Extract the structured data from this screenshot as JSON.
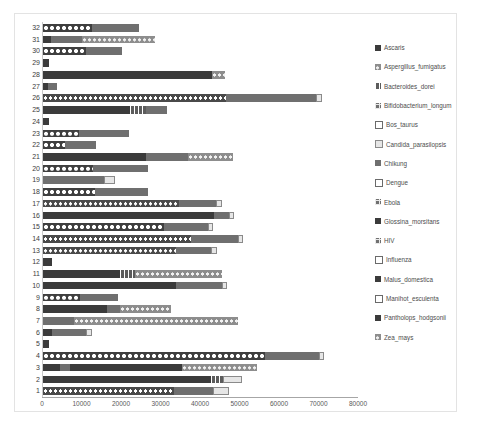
{
  "chart_data": {
    "type": "bar",
    "orientation": "horizontal",
    "stacked": true,
    "title": "",
    "xlabel": "",
    "ylabel": "",
    "xlim": [
      0,
      80000
    ],
    "xticks": [
      0,
      10000,
      20000,
      30000,
      40000,
      50000,
      60000,
      70000,
      80000
    ],
    "xtick_labels": [
      "0",
      "10000",
      "20000",
      "30000",
      "40000",
      "50000",
      "60000",
      "70000",
      "80000"
    ],
    "grid": false,
    "legend_position": "right",
    "categories": [
      "1",
      "2",
      "3",
      "4",
      "5",
      "6",
      "7",
      "8",
      "9",
      "10",
      "11",
      "12",
      "13",
      "14",
      "15",
      "16",
      "17",
      "18",
      "19",
      "20",
      "21",
      "22",
      "23",
      "24",
      "25",
      "26",
      "27",
      "28",
      "29",
      "30",
      "31",
      "32"
    ],
    "series": [
      {
        "name": "Ascaris",
        "pattern": "solidDark",
        "color": "#3b3b3b"
      },
      {
        "name": "Aspergillus_fumigatus",
        "pattern": "dotsGray",
        "color": "#8d8d8d"
      },
      {
        "name": "Bacteroides_dorei",
        "pattern": "hatch",
        "color": "#5c5c5c"
      },
      {
        "name": "Bifidobacterium_longum",
        "pattern": "grid",
        "color": "#707070"
      },
      {
        "name": "Bos_taurus",
        "pattern": "open",
        "color": "#ffffff"
      },
      {
        "name": "Candida_parasilopsis",
        "pattern": "openGray",
        "color": "#e6e6e6"
      },
      {
        "name": "Chikung",
        "pattern": "solidMid",
        "color": "#6f6f6f"
      },
      {
        "name": "Dengue",
        "pattern": "open",
        "color": "#ffffff"
      },
      {
        "name": "Ebola",
        "pattern": "grid",
        "color": "#707070"
      },
      {
        "name": "Glossina_morsitans",
        "pattern": "solidDark",
        "color": "#3b3b3b"
      },
      {
        "name": "HIV",
        "pattern": "grid",
        "color": "#707070"
      },
      {
        "name": "Influenza",
        "pattern": "open",
        "color": "#ffffff"
      },
      {
        "name": "Malus_domestica",
        "pattern": "solidDark",
        "color": "#3b3b3b"
      },
      {
        "name": "Manihot_esculenta",
        "pattern": "open",
        "color": "#ffffff"
      },
      {
        "name": "Pantholops_hodgsonii",
        "pattern": "solidDark",
        "color": "#3b3b3b"
      },
      {
        "name": "Zea_mays",
        "pattern": "dotsGray",
        "color": "#8d8d8d"
      }
    ],
    "rows": [
      {
        "category": "32",
        "total": 24300,
        "segments": [
          {
            "pattern": "starWhite",
            "value": 12400
          },
          {
            "pattern": "solidMid",
            "value": 11900
          }
        ]
      },
      {
        "category": "31",
        "total": 28400,
        "segments": [
          {
            "pattern": "solidDark",
            "value": 2100
          },
          {
            "pattern": "solidMid",
            "value": 7700
          },
          {
            "pattern": "dotsGray",
            "value": 18600
          }
        ]
      },
      {
        "category": "30",
        "total": 19900,
        "segments": [
          {
            "pattern": "starWhite",
            "value": 10900
          },
          {
            "pattern": "solidMid",
            "value": 9000
          }
        ]
      },
      {
        "category": "29",
        "total": 1500,
        "segments": [
          {
            "pattern": "solidDark",
            "value": 1500
          }
        ]
      },
      {
        "category": "28",
        "total": 46200,
        "segments": [
          {
            "pattern": "solidDark",
            "value": 42800
          },
          {
            "pattern": "dotsGray",
            "value": 3400
          }
        ]
      },
      {
        "category": "27",
        "total": 3500,
        "segments": [
          {
            "pattern": "solidDark",
            "value": 1300
          },
          {
            "pattern": "solidMid",
            "value": 2200
          }
        ]
      },
      {
        "category": "26",
        "total": 70600,
        "segments": [
          {
            "pattern": "dotsWhite",
            "value": 46300
          },
          {
            "pattern": "solidMid",
            "value": 22900
          },
          {
            "pattern": "openGray",
            "value": 1400
          }
        ]
      },
      {
        "category": "25",
        "total": 31300,
        "segments": [
          {
            "pattern": "solidDark",
            "value": 22100
          },
          {
            "pattern": "hatch",
            "value": 4100
          },
          {
            "pattern": "solidMid",
            "value": 5100
          }
        ]
      },
      {
        "category": "24",
        "total": 1600,
        "segments": [
          {
            "pattern": "solidDark",
            "value": 1600
          }
        ]
      },
      {
        "category": "23",
        "total": 21700,
        "segments": [
          {
            "pattern": "starWhite",
            "value": 9100
          },
          {
            "pattern": "solidMid",
            "value": 12600
          }
        ]
      },
      {
        "category": "22",
        "total": 13400,
        "segments": [
          {
            "pattern": "starWhite",
            "value": 5600
          },
          {
            "pattern": "solidMid",
            "value": 7800
          }
        ]
      },
      {
        "category": "21",
        "total": 48100,
        "segments": [
          {
            "pattern": "solidDark",
            "value": 26100
          },
          {
            "pattern": "solidMid",
            "value": 10600
          },
          {
            "pattern": "dotsGray",
            "value": 11400
          }
        ]
      },
      {
        "category": "20",
        "total": 26600,
        "segments": [
          {
            "pattern": "starWhite",
            "value": 12700
          },
          {
            "pattern": "solidMid",
            "value": 13900
          }
        ]
      },
      {
        "category": "19",
        "total": 18200,
        "segments": [
          {
            "pattern": "solidMid",
            "value": 15400
          },
          {
            "pattern": "openGray",
            "value": 2800
          }
        ]
      },
      {
        "category": "18",
        "total": 26600,
        "segments": [
          {
            "pattern": "starWhite",
            "value": 13200
          },
          {
            "pattern": "solidMid",
            "value": 13400
          }
        ]
      },
      {
        "category": "17",
        "total": 45200,
        "segments": [
          {
            "pattern": "dotsWhite",
            "value": 34400
          },
          {
            "pattern": "solidMid",
            "value": 9400
          },
          {
            "pattern": "openGray",
            "value": 1400
          }
        ]
      },
      {
        "category": "16",
        "total": 48400,
        "segments": [
          {
            "pattern": "solidDark",
            "value": 43300
          },
          {
            "pattern": "solidMid",
            "value": 3700
          },
          {
            "pattern": "openGray",
            "value": 1400
          }
        ]
      },
      {
        "category": "15",
        "total": 43100,
        "segments": [
          {
            "pattern": "starWhite",
            "value": 30700
          },
          {
            "pattern": "solidMid",
            "value": 11000
          },
          {
            "pattern": "openGray",
            "value": 1400
          }
        ]
      },
      {
        "category": "14",
        "total": 50700,
        "segments": [
          {
            "pattern": "dotsWhite",
            "value": 37400
          },
          {
            "pattern": "solidMid",
            "value": 11900
          },
          {
            "pattern": "openGray",
            "value": 1400
          }
        ]
      },
      {
        "category": "13",
        "total": 44000,
        "segments": [
          {
            "pattern": "dotsWhite",
            "value": 33600
          },
          {
            "pattern": "solidMid",
            "value": 9000
          },
          {
            "pattern": "openGray",
            "value": 1400
          }
        ]
      },
      {
        "category": "12",
        "total": 2300,
        "segments": [
          {
            "pattern": "solidDark",
            "value": 2300
          }
        ]
      },
      {
        "category": "11",
        "total": 45400,
        "segments": [
          {
            "pattern": "solidDark",
            "value": 19400
          },
          {
            "pattern": "hatch",
            "value": 4000
          },
          {
            "pattern": "dotsGray",
            "value": 22000
          }
        ]
      },
      {
        "category": "10",
        "total": 46700,
        "segments": [
          {
            "pattern": "solidDark",
            "value": 33600
          },
          {
            "pattern": "solidMid",
            "value": 11700
          },
          {
            "pattern": "openGray",
            "value": 1400
          }
        ]
      },
      {
        "category": "9",
        "total": 19100,
        "segments": [
          {
            "pattern": "starWhite",
            "value": 9400
          },
          {
            "pattern": "solidMid",
            "value": 9700
          }
        ]
      },
      {
        "category": "8",
        "total": 32400,
        "segments": [
          {
            "pattern": "solidDark",
            "value": 16100
          },
          {
            "pattern": "solidMid",
            "value": 3500
          },
          {
            "pattern": "dotsGray",
            "value": 12800
          }
        ]
      },
      {
        "category": "7",
        "total": 49400,
        "segments": [
          {
            "pattern": "solidMid",
            "value": 7900
          },
          {
            "pattern": "dotsGray",
            "value": 41500
          }
        ]
      },
      {
        "category": "6",
        "total": 12300,
        "segments": [
          {
            "pattern": "solidDark",
            "value": 2300
          },
          {
            "pattern": "solidMid",
            "value": 8600
          },
          {
            "pattern": "openGray",
            "value": 1400
          }
        ]
      },
      {
        "category": "5",
        "total": 1400,
        "segments": [
          {
            "pattern": "solidDark",
            "value": 1400
          }
        ]
      },
      {
        "category": "4",
        "total": 71200,
        "segments": [
          {
            "pattern": "starWhite",
            "value": 56300
          },
          {
            "pattern": "solidMid",
            "value": 13500
          },
          {
            "pattern": "openGray",
            "value": 1400
          }
        ]
      },
      {
        "category": "3",
        "total": 54300,
        "segments": [
          {
            "pattern": "solidDark",
            "value": 4200
          },
          {
            "pattern": "solidMid",
            "value": 2600
          },
          {
            "pattern": "solidDark",
            "value": 28500
          },
          {
            "pattern": "dotsGray",
            "value": 19000
          }
        ]
      },
      {
        "category": "2",
        "total": 50400,
        "segments": [
          {
            "pattern": "solidDark",
            "value": 42600
          },
          {
            "pattern": "hatch",
            "value": 2900
          },
          {
            "pattern": "openGray",
            "value": 4900
          }
        ]
      },
      {
        "category": "1",
        "total": 47000,
        "segments": [
          {
            "pattern": "dotsWhite",
            "value": 33200
          },
          {
            "pattern": "solidMid",
            "value": 9800
          },
          {
            "pattern": "openGray",
            "value": 4000
          }
        ]
      }
    ]
  }
}
